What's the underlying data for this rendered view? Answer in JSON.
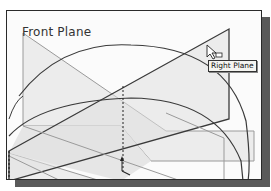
{
  "viewport": {
    "label": "Front Plane",
    "tooltip": "Right Plane",
    "cursor": "select-arrow-with-plane",
    "colors": {
      "background": "#fbfbfb",
      "plane_fill": "#e8e8e8",
      "plane_edge_light": "#9a9a9a",
      "edge_dark": "#3a3a3a",
      "border": "#2a2a2a",
      "shadow": "#5a5a5a"
    }
  }
}
